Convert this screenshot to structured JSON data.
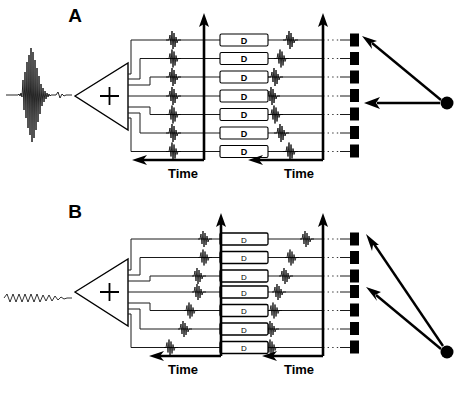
{
  "figure": {
    "type": "diagram",
    "width": 469,
    "height": 393,
    "background_color": "#ffffff",
    "line_color": "#000000"
  },
  "panels": [
    {
      "id": "A",
      "label": "A",
      "label_x": 75,
      "label_y": 22,
      "origin_y": 0,
      "source_waveform": {
        "name": "input-waveform-a",
        "description": "sharp high-amplitude impulse / broadband click",
        "style": "impulse",
        "amplitude": "high",
        "center_x": 36,
        "center_y": 95
      },
      "summing_amplifier": {
        "name": "summing-amplifier-a",
        "symbol": "+",
        "apex_x": 75,
        "base_x": 128,
        "top_y": 63,
        "bottom_y": 130
      },
      "channels": 7,
      "input_column_alignment": "aligned",
      "output_column_alignment": "chevron",
      "delay_boxes": {
        "label": "D",
        "count": 7,
        "style": "bold",
        "name": "delay-box"
      },
      "time_axes": [
        {
          "name": "time-axis-left-a",
          "label": "Time",
          "label_x": 183,
          "label_y": 178,
          "direction": "leftward"
        },
        {
          "name": "time-axis-right-a",
          "label": "Time",
          "label_x": 299,
          "label_y": 178,
          "direction": "leftward"
        }
      ],
      "receiver_array": {
        "name": "receiver-array-a",
        "elements": 7,
        "x": 351,
        "color": "#000000"
      },
      "wavefront_source": {
        "name": "point-source-a",
        "x": 447,
        "y": 103,
        "arrow_targets": [
          1,
          4
        ],
        "description": "distant point source emitting toward elements 1 and 4"
      }
    },
    {
      "id": "B",
      "label": "B",
      "label_x": 75,
      "label_y": 218,
      "origin_y": 196,
      "source_waveform": {
        "name": "input-waveform-b",
        "description": "low-amplitude continuous oscillation / narrowband tone",
        "style": "oscillation",
        "amplitude": "low",
        "center_x": 36,
        "center_y": 298
      },
      "summing_amplifier": {
        "name": "summing-amplifier-b",
        "symbol": "+",
        "apex_x": 75,
        "base_x": 128,
        "top_y": 259,
        "bottom_y": 326
      },
      "channels": 7,
      "input_column_alignment": "diagonal",
      "output_column_alignment": "diagonal",
      "delay_boxes": {
        "label": "D",
        "count": 7,
        "style": "thin",
        "name": "delay-box"
      },
      "time_axes": [
        {
          "name": "time-axis-left-b",
          "label": "Time",
          "label_x": 183,
          "label_y": 374,
          "direction": "leftward"
        },
        {
          "name": "time-axis-right-b",
          "label": "Time",
          "label_x": 299,
          "label_y": 374,
          "direction": "leftward"
        }
      ],
      "receiver_array": {
        "name": "receiver-array-b",
        "elements": 7,
        "x": 351,
        "color": "#000000"
      },
      "wavefront_source": {
        "name": "point-source-b",
        "x": 447,
        "y": 352,
        "arrow_targets": [
          1,
          4
        ],
        "description": "point source below the array emitting toward elements 1 and 4"
      }
    }
  ],
  "geometry": {
    "row_spacing": 18.5,
    "first_row_y_a": 40,
    "first_row_y_b": 239,
    "input_wave_x_a": 173,
    "axis1_x": 204,
    "dbox_x": 220,
    "dbox_w": 48,
    "dbox_h": 12,
    "axis2_x": 323,
    "bar_x": 350,
    "bar_w": 9,
    "bar_h": 13
  },
  "legend": {
    "d_meaning": "D",
    "time_label": "Time"
  }
}
